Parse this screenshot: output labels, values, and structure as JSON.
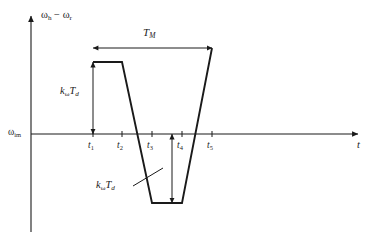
{
  "figure": {
    "type": "waveform-diagram",
    "background_color": "#ffffff",
    "line_color": "#1a1a1a"
  },
  "axes": {
    "y_axis_label": "ω<sub>h</sub> − ω<sub>r</sub>",
    "y_axis_label_plain": "omega_h - omega_r",
    "x_axis_label": "t",
    "baseline_label": "ω<sub>im</sub>",
    "baseline_label_plain": "omega_im"
  },
  "ticks": [
    {
      "label": "t",
      "sub": "1",
      "x": 93
    },
    {
      "label": "t",
      "sub": "2",
      "x": 122
    },
    {
      "label": "t",
      "sub": "3",
      "x": 152
    },
    {
      "label": "t",
      "sub": "4",
      "x": 182
    },
    {
      "label": "t",
      "sub": "5",
      "x": 212
    }
  ],
  "annotations": {
    "span_total": {
      "label": "T",
      "sub": "M",
      "from_tick": "t1",
      "to_tick": "t5"
    },
    "measure_upper": {
      "label": "k",
      "sub1": "ω",
      "label2": "T",
      "sub2": "d"
    },
    "measure_lower": {
      "label": "k",
      "sub1": "ω",
      "label2": "T",
      "sub2": "d"
    }
  },
  "chart_data": {
    "type": "line",
    "title": "",
    "xlabel": "t",
    "ylabel": "ω_h − ω_r",
    "grid": false,
    "legend": false,
    "baseline_value": "ω_im",
    "x_tick_labels": [
      "t_1",
      "t_2",
      "t_3",
      "t_4",
      "t_5"
    ],
    "series": [
      {
        "name": "omega_h minus omega_r",
        "points": [
          {
            "x": "t_1",
            "y": "+k_w*T_d"
          },
          {
            "x": "t_2",
            "y": "+k_w*T_d"
          },
          {
            "x": "t_3",
            "y": "-k_w*T_d"
          },
          {
            "x": "t_4",
            "y": "-k_w*T_d"
          },
          {
            "x": "t_5",
            "y": "+k_w*T_d"
          }
        ]
      }
    ],
    "annotations": [
      {
        "text": "T_M",
        "kind": "horizontal-span",
        "from": "t_1",
        "to": "t_5"
      },
      {
        "text": "k_ω T_d",
        "kind": "vertical-measure",
        "from": "ω_im",
        "to": "+k_w*T_d"
      },
      {
        "text": "k_ω T_d",
        "kind": "vertical-measure",
        "from": "ω_im",
        "to": "-k_w*T_d"
      }
    ]
  }
}
